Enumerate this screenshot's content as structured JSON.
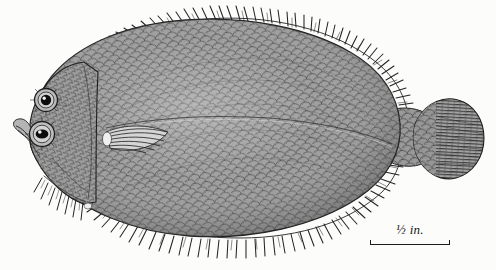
{
  "plate": {
    "title": "Flatfish lateral view engraving",
    "subject_name": "flatfish",
    "background_color": "#fcfcfb",
    "ink_color": "#1b1b1b",
    "body_fill": "#8d8d8d",
    "width": 496,
    "height": 270
  },
  "scale_bar": {
    "label": "½ in.",
    "x": 368,
    "y": 222,
    "length_px": 80,
    "tick_height_px": 5,
    "color": "#1b1b1b"
  },
  "anatomy": {
    "parts": [
      {
        "name": "dorsal-fin",
        "label": "dorsal fin"
      },
      {
        "name": "anal-fin",
        "label": "anal fin"
      },
      {
        "name": "caudal-fin",
        "label": "caudal fin"
      },
      {
        "name": "pectoral-fin",
        "label": "pectoral fin"
      },
      {
        "name": "pelvic-fin",
        "label": "pelvic fin"
      },
      {
        "name": "upper-eye",
        "label": "upper eye"
      },
      {
        "name": "lower-eye",
        "label": "lower eye"
      },
      {
        "name": "snout",
        "label": "snout"
      },
      {
        "name": "body-scales",
        "label": "scaled body"
      },
      {
        "name": "lateral-line",
        "label": "lateral line"
      },
      {
        "name": "caudal-peduncle",
        "label": "caudal peduncle"
      }
    ]
  }
}
